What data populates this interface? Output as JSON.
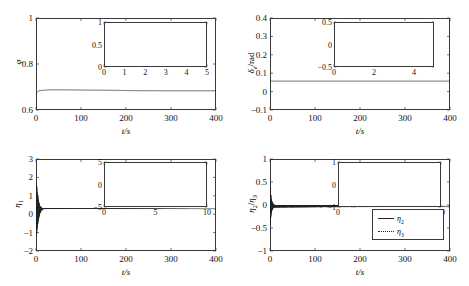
{
  "figure": {
    "background": "#ffffff",
    "line_color": "#222222",
    "axis_color": "#3a3a3a"
  },
  "chart_data": [
    {
      "id": "phi-plot",
      "type": "line",
      "title": "",
      "xlabel": "t/s",
      "ylabel": "φ",
      "xlim": [
        0,
        400
      ],
      "ylim": [
        0.6,
        1.0
      ],
      "xticks": [
        0,
        100,
        200,
        300,
        400
      ],
      "xticklabels": [
        "0",
        "100",
        "200",
        "300",
        "400"
      ],
      "yticks": [
        0.6,
        0.8,
        1.0
      ],
      "yticklabels": [
        "0.6",
        "0.8",
        "1"
      ],
      "grid": false,
      "legend": null,
      "series": [
        {
          "name": "φ",
          "style": "solid",
          "x": [
            0,
            2,
            5,
            8,
            12,
            18,
            25,
            35,
            50,
            70,
            95,
            120,
            150,
            180,
            200,
            230,
            260,
            300,
            340,
            370,
            400
          ],
          "y": [
            0.665,
            0.676,
            0.682,
            0.684,
            0.685,
            0.686,
            0.687,
            0.688,
            0.688,
            0.6875,
            0.687,
            0.6865,
            0.686,
            0.6855,
            0.6845,
            0.684,
            0.6838,
            0.6836,
            0.6835,
            0.6835,
            0.6835
          ]
        }
      ],
      "inset": {
        "xlim": [
          0,
          5
        ],
        "ylim": [
          0,
          1
        ],
        "xticks": [
          0,
          1,
          2,
          3,
          4,
          5
        ],
        "xticklabels": [
          "0",
          "1",
          "2",
          "3",
          "4",
          "5"
        ],
        "yticks": [
          0,
          0.5,
          1
        ],
        "yticklabels": [
          "0",
          "0.5",
          "1"
        ],
        "series": [
          {
            "name": "φ",
            "style": "solid",
            "x": [
              0,
              0.05,
              0.1,
              0.15,
              0.2,
              0.24,
              0.28,
              0.32,
              0.36,
              0.4,
              0.44,
              0.48,
              0.52,
              0.58,
              0.65,
              0.72,
              0.8,
              0.9,
              1.0,
              1.2,
              1.5,
              1.8,
              2.2,
              2.6,
              3.0,
              3.5,
              4.0,
              4.5,
              5.0
            ],
            "y": [
              0.47,
              0.5,
              0.62,
              0.83,
              0.7,
              0.93,
              0.74,
              0.96,
              0.73,
              0.88,
              0.7,
              0.78,
              0.66,
              0.63,
              0.6,
              0.585,
              0.575,
              0.565,
              0.558,
              0.548,
              0.54,
              0.535,
              0.528,
              0.524,
              0.521,
              0.518,
              0.516,
              0.515,
              0.515
            ]
          }
        ]
      }
    },
    {
      "id": "delta-e-plot",
      "type": "line",
      "title": "",
      "xlabel": "t/s",
      "ylabel": "δe/rad",
      "xlim": [
        0,
        400
      ],
      "ylim": [
        -0.1,
        0.4
      ],
      "xticks": [
        0,
        100,
        200,
        300,
        400
      ],
      "xticklabels": [
        "0",
        "100",
        "200",
        "300",
        "400"
      ],
      "yticks": [
        -0.1,
        0,
        0.1,
        0.2,
        0.3,
        0.4
      ],
      "yticklabels": [
        "−0.1",
        "0",
        "0.1",
        "0.2",
        "0.3",
        "0.4"
      ],
      "grid": false,
      "legend": null,
      "series": [
        {
          "name": "δe",
          "style": "solid",
          "x": [
            0,
            5,
            20,
            60,
            120,
            200,
            280,
            340,
            400
          ],
          "y": [
            0.057,
            0.057,
            0.057,
            0.057,
            0.057,
            0.057,
            0.057,
            0.057,
            0.057
          ]
        }
      ],
      "inset": {
        "xlim": [
          0,
          5
        ],
        "ylim": [
          -0.5,
          0.5
        ],
        "xticks": [
          0,
          2,
          4
        ],
        "xticklabels": [
          "0",
          "2",
          "4"
        ],
        "yticks": [
          -0.5,
          0,
          0.5
        ],
        "yticklabels": [
          "−0.5",
          "0",
          "0.5"
        ],
        "series": [
          {
            "name": "δe",
            "style": "solid",
            "x": [
              0,
              0.06,
              0.12,
              0.18,
              0.24,
              0.3,
              0.36,
              0.42,
              0.5,
              0.58,
              0.66,
              0.75,
              0.85,
              0.95,
              1.1,
              1.3,
              1.6,
              2.0,
              2.5,
              3.0,
              3.5,
              4.0,
              4.5,
              5.0
            ],
            "y": [
              0.0,
              0.44,
              0.1,
              -0.16,
              0.3,
              0.05,
              -0.2,
              0.12,
              0.0,
              -0.09,
              0.04,
              0.03,
              0.0,
              0.02,
              0.02,
              0.02,
              0.02,
              0.02,
              0.02,
              0.02,
              0.02,
              0.02,
              0.02,
              0.02
            ]
          }
        ]
      }
    },
    {
      "id": "eta1-plot",
      "type": "line",
      "title": "",
      "xlabel": "t/s",
      "ylabel": "η1",
      "xlim": [
        0,
        400
      ],
      "ylim": [
        -2,
        3
      ],
      "xticks": [
        0,
        100,
        200,
        300,
        400
      ],
      "xticklabels": [
        "0",
        "100",
        "200",
        "300",
        "400"
      ],
      "yticks": [
        -2,
        -1,
        0,
        1,
        2,
        3
      ],
      "yticklabels": [
        "−2",
        "−1",
        "0",
        "1",
        "2",
        "3"
      ],
      "grid": false,
      "legend": null,
      "series": [
        {
          "name": "η1",
          "style": "solid",
          "description": "sharp decaying transient burst near t=0 spanning about -1.3 to 1.8, settling to 0.3",
          "envelope_x": [
            0,
            1,
            2,
            3,
            5,
            7,
            9,
            12,
            16,
            400
          ],
          "envelope_hi": [
            1.8,
            1.7,
            1.5,
            1.2,
            0.85,
            0.6,
            0.45,
            0.36,
            0.31,
            0.3
          ],
          "envelope_lo": [
            -1.3,
            -1.2,
            -1.0,
            -0.75,
            -0.4,
            -0.15,
            0.05,
            0.2,
            0.28,
            0.3
          ],
          "settle_value": 0.3
        }
      ],
      "inset": {
        "xlim": [
          0,
          10
        ],
        "ylim": [
          -5,
          5
        ],
        "xticks": [
          0,
          5,
          10
        ],
        "xticklabels": [
          "0",
          "5",
          "10"
        ],
        "yticks": [
          -5,
          0,
          5
        ],
        "yticklabels": [
          "−5",
          "0",
          "5"
        ],
        "series": [
          {
            "name": "η1",
            "style": "solid",
            "description": "damped oscillation starting near ±3 decaying to 0 by about t=8",
            "envelope_x": [
              0,
              0.5,
              1,
              1.5,
              2,
              3,
              4,
              5,
              6,
              7,
              8,
              9,
              10
            ],
            "envelope_hi": [
              2.9,
              2.6,
              2.2,
              1.9,
              1.6,
              1.15,
              0.85,
              0.6,
              0.42,
              0.28,
              0.18,
              0.12,
              0.1
            ],
            "envelope_lo": [
              -2.6,
              -2.4,
              -2.0,
              -1.7,
              -1.4,
              -1.0,
              -0.72,
              -0.5,
              -0.34,
              -0.22,
              -0.14,
              -0.1,
              -0.08
            ],
            "oscillation_period": 0.34
          }
        ]
      }
    },
    {
      "id": "eta2-eta3-plot",
      "type": "line",
      "title": "",
      "xlabel": "t/s",
      "ylabel": "η2/η3",
      "xlim": [
        0,
        400
      ],
      "ylim": [
        -1,
        1
      ],
      "xticks": [
        0,
        100,
        200,
        300,
        400
      ],
      "xticklabels": [
        "0",
        "100",
        "200",
        "300",
        "400"
      ],
      "yticks": [
        -1,
        -0.5,
        0,
        0.5,
        1
      ],
      "yticklabels": [
        "−1",
        "−0.5",
        "0",
        "0.5",
        "1"
      ],
      "grid": false,
      "legend": {
        "position": "lower-right",
        "entries": [
          {
            "label": "η2",
            "style": "solid"
          },
          {
            "label": "η3",
            "style": "dotted"
          }
        ]
      },
      "series": [
        {
          "name": "η2",
          "style": "solid",
          "description": "narrow transient spike at t=0 then flat at about -0.03",
          "envelope_x": [
            0,
            1,
            3,
            6,
            10,
            400
          ],
          "envelope_hi": [
            0.55,
            0.3,
            0.12,
            0.04,
            0.0,
            -0.03
          ],
          "envelope_lo": [
            -0.6,
            -0.35,
            -0.16,
            -0.08,
            -0.05,
            -0.03
          ],
          "settle_value": -0.03
        },
        {
          "name": "η3",
          "style": "dotted",
          "description": "narrow transient spike at t=0 then flat at about -0.04",
          "envelope_x": [
            0,
            1,
            3,
            6,
            10,
            400
          ],
          "envelope_hi": [
            0.5,
            0.26,
            0.1,
            0.03,
            0.0,
            -0.04
          ],
          "envelope_lo": [
            -0.55,
            -0.32,
            -0.14,
            -0.07,
            -0.05,
            -0.04
          ],
          "settle_value": -0.04
        }
      ],
      "inset": {
        "xlim": [
          0,
          10
        ],
        "ylim": [
          -1,
          1
        ],
        "xticks": [
          0,
          5,
          10
        ],
        "xticklabels": [
          "0",
          "5",
          "10"
        ],
        "yticks": [
          -1,
          0,
          1
        ],
        "yticklabels": [
          "−1",
          "0",
          "1"
        ],
        "series": [
          {
            "name": "η2",
            "style": "solid",
            "description": "dense damped oscillation from about ±0.85 decaying to 0 by t=4",
            "envelope_x": [
              0,
              0.25,
              0.5,
              0.8,
              1.2,
              1.6,
              2.0,
              2.5,
              3.0,
              4.0,
              5.0,
              7.0,
              10.0
            ],
            "envelope_hi": [
              0.85,
              0.72,
              0.55,
              0.4,
              0.27,
              0.18,
              0.12,
              0.07,
              0.045,
              0.02,
              0.012,
              0.006,
              0.004
            ],
            "envelope_lo": [
              -0.8,
              -0.7,
              -0.52,
              -0.38,
              -0.25,
              -0.17,
              -0.11,
              -0.065,
              -0.04,
              -0.018,
              -0.01,
              -0.005,
              -0.003
            ],
            "oscillation_period": 0.13
          },
          {
            "name": "η3",
            "style": "dotted",
            "description": "dense damped oscillation closely tracking η2",
            "envelope_x": [
              0,
              0.25,
              0.5,
              0.8,
              1.2,
              1.6,
              2.0,
              2.5,
              3.0,
              4.0,
              5.0,
              7.0,
              10.0
            ],
            "envelope_hi": [
              0.78,
              0.66,
              0.5,
              0.36,
              0.24,
              0.16,
              0.1,
              0.06,
              0.04,
              0.018,
              0.01,
              0.005,
              0.003
            ],
            "envelope_lo": [
              -0.74,
              -0.64,
              -0.47,
              -0.34,
              -0.22,
              -0.15,
              -0.095,
              -0.055,
              -0.035,
              -0.016,
              -0.009,
              -0.004,
              -0.003
            ],
            "oscillation_period": 0.13
          }
        ]
      }
    }
  ]
}
